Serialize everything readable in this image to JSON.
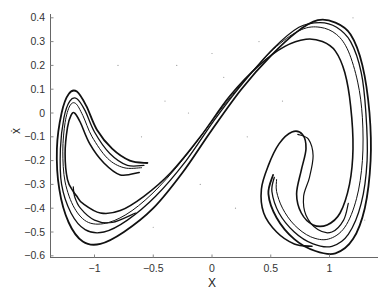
{
  "chart_data": {
    "type": "line",
    "title": "",
    "subtitle": "",
    "xlabel": "X",
    "ylabel": "ẋ",
    "xlim": [
      -1.38,
      1.41
    ],
    "ylim": [
      -0.6,
      0.42
    ],
    "x_ticks": [
      -1,
      -0.5,
      0,
      0.5,
      1
    ],
    "x_tick_labels": [
      "−1",
      "−0.5",
      "0",
      "0.5",
      "1"
    ],
    "y_ticks": [
      0.4,
      0.3,
      0.2,
      0.1,
      0,
      -0.1,
      -0.2,
      -0.3,
      -0.4,
      -0.5,
      -0.6
    ],
    "y_tick_labels": [
      "0.4",
      "0.3",
      "0.2",
      "0.1",
      "0",
      "−0.1",
      "−0.2",
      "−0.3",
      "−0.4",
      "−0.5",
      "−0.6"
    ],
    "grid": false,
    "legend": null,
    "series_color": "#111111",
    "series": [
      {
        "name": "outer-band",
        "width": 1.8,
        "points": [
          [
            -0.55,
            -0.21
          ],
          [
            -0.7,
            -0.2
          ],
          [
            -0.85,
            -0.15
          ],
          [
            -0.98,
            -0.07
          ],
          [
            -1.07,
            0.03
          ],
          [
            -1.15,
            0.09
          ],
          [
            -1.22,
            0.08
          ],
          [
            -1.28,
            0.0
          ],
          [
            -1.32,
            -0.15
          ],
          [
            -1.3,
            -0.32
          ],
          [
            -1.22,
            -0.46
          ],
          [
            -1.1,
            -0.54
          ],
          [
            -0.95,
            -0.55
          ],
          [
            -0.75,
            -0.5
          ],
          [
            -0.5,
            -0.4
          ],
          [
            -0.25,
            -0.25
          ],
          [
            0.0,
            -0.07
          ],
          [
            0.25,
            0.1
          ],
          [
            0.5,
            0.24
          ],
          [
            0.72,
            0.34
          ],
          [
            0.9,
            0.39
          ],
          [
            1.05,
            0.38
          ],
          [
            1.18,
            0.33
          ],
          [
            1.28,
            0.2
          ],
          [
            1.34,
            0.0
          ],
          [
            1.35,
            -0.2
          ],
          [
            1.3,
            -0.4
          ],
          [
            1.2,
            -0.53
          ],
          [
            1.05,
            -0.59
          ],
          [
            0.88,
            -0.58
          ],
          [
            0.7,
            -0.53
          ],
          [
            0.55,
            -0.44
          ],
          [
            0.48,
            -0.34
          ],
          [
            0.52,
            -0.26
          ]
        ]
      },
      {
        "name": "band-2",
        "width": 1.3,
        "points": [
          [
            -0.58,
            -0.22
          ],
          [
            -0.72,
            -0.22
          ],
          [
            -0.87,
            -0.17
          ],
          [
            -1.0,
            -0.08
          ],
          [
            -1.08,
            0.01
          ],
          [
            -1.15,
            0.06
          ],
          [
            -1.21,
            0.05
          ],
          [
            -1.26,
            -0.02
          ],
          [
            -1.29,
            -0.15
          ],
          [
            -1.28,
            -0.3
          ],
          [
            -1.2,
            -0.42
          ],
          [
            -1.08,
            -0.49
          ],
          [
            -0.92,
            -0.5
          ],
          [
            -0.72,
            -0.45
          ],
          [
            -0.48,
            -0.35
          ],
          [
            -0.22,
            -0.2
          ],
          [
            0.02,
            -0.03
          ],
          [
            0.27,
            0.13
          ],
          [
            0.52,
            0.27
          ],
          [
            0.74,
            0.36
          ],
          [
            0.92,
            0.38
          ],
          [
            1.06,
            0.36
          ],
          [
            1.18,
            0.3
          ],
          [
            1.27,
            0.17
          ],
          [
            1.31,
            0.0
          ],
          [
            1.32,
            -0.2
          ],
          [
            1.27,
            -0.38
          ],
          [
            1.16,
            -0.51
          ],
          [
            1.02,
            -0.56
          ],
          [
            0.86,
            -0.55
          ],
          [
            0.7,
            -0.5
          ],
          [
            0.57,
            -0.42
          ],
          [
            0.51,
            -0.33
          ],
          [
            0.53,
            -0.27
          ]
        ]
      },
      {
        "name": "band-3",
        "width": 1.0,
        "points": [
          [
            -0.6,
            -0.23
          ],
          [
            -0.75,
            -0.23
          ],
          [
            -0.89,
            -0.19
          ],
          [
            -1.02,
            -0.1
          ],
          [
            -1.1,
            -0.01
          ],
          [
            -1.16,
            0.04
          ],
          [
            -1.21,
            0.03
          ],
          [
            -1.25,
            -0.04
          ],
          [
            -1.27,
            -0.16
          ],
          [
            -1.25,
            -0.29
          ],
          [
            -1.17,
            -0.4
          ],
          [
            -1.05,
            -0.46
          ],
          [
            -0.88,
            -0.46
          ],
          [
            -0.68,
            -0.41
          ],
          [
            -0.45,
            -0.31
          ],
          [
            -0.19,
            -0.16
          ],
          [
            0.05,
            0.0
          ],
          [
            0.3,
            0.15
          ],
          [
            0.55,
            0.28
          ],
          [
            0.76,
            0.35
          ],
          [
            0.92,
            0.36
          ],
          [
            1.06,
            0.33
          ],
          [
            1.16,
            0.26
          ],
          [
            1.24,
            0.13
          ],
          [
            1.28,
            -0.02
          ],
          [
            1.28,
            -0.2
          ],
          [
            1.23,
            -0.36
          ],
          [
            1.13,
            -0.48
          ],
          [
            0.99,
            -0.53
          ],
          [
            0.84,
            -0.52
          ],
          [
            0.7,
            -0.47
          ],
          [
            0.6,
            -0.4
          ],
          [
            0.55,
            -0.33
          ],
          [
            0.55,
            -0.28
          ]
        ]
      },
      {
        "name": "inner-band",
        "width": 1.6,
        "points": [
          [
            -0.62,
            -0.25
          ],
          [
            -0.78,
            -0.26
          ],
          [
            -0.92,
            -0.21
          ],
          [
            -1.04,
            -0.13
          ],
          [
            -1.12,
            -0.04
          ],
          [
            -1.17,
            0.0
          ],
          [
            -1.2,
            -0.01
          ],
          [
            -1.23,
            -0.06
          ],
          [
            -1.25,
            -0.17
          ],
          [
            -1.23,
            -0.28
          ],
          [
            -1.18,
            -0.33
          ],
          [
            -1.15,
            -0.35
          ],
          [
            -1.1,
            -0.38
          ],
          [
            -0.95,
            -0.42
          ],
          [
            -0.78,
            -0.41
          ],
          [
            -0.58,
            -0.35
          ],
          [
            -0.35,
            -0.25
          ],
          [
            -0.1,
            -0.1
          ],
          [
            0.15,
            0.07
          ],
          [
            0.4,
            0.2
          ],
          [
            0.62,
            0.28
          ],
          [
            0.8,
            0.31
          ],
          [
            0.94,
            0.3
          ],
          [
            1.05,
            0.26
          ],
          [
            1.13,
            0.17
          ],
          [
            1.18,
            0.03
          ],
          [
            1.2,
            -0.15
          ],
          [
            1.17,
            -0.3
          ],
          [
            1.09,
            -0.42
          ],
          [
            0.98,
            -0.47
          ],
          [
            0.86,
            -0.47
          ],
          [
            0.76,
            -0.42
          ],
          [
            0.72,
            -0.34
          ],
          [
            0.76,
            -0.24
          ],
          [
            0.8,
            -0.15
          ],
          [
            0.77,
            -0.09
          ],
          [
            0.68,
            -0.08
          ],
          [
            0.57,
            -0.13
          ],
          [
            0.48,
            -0.22
          ],
          [
            0.42,
            -0.32
          ],
          [
            0.44,
            -0.42
          ],
          [
            0.55,
            -0.5
          ],
          [
            0.7,
            -0.55
          ],
          [
            0.85,
            -0.56
          ]
        ]
      },
      {
        "name": "right-lobe-inner",
        "width": 1.2,
        "points": [
          [
            0.73,
            -0.09
          ],
          [
            0.82,
            -0.11
          ],
          [
            0.86,
            -0.18
          ],
          [
            0.83,
            -0.27
          ],
          [
            0.78,
            -0.35
          ],
          [
            0.8,
            -0.43
          ],
          [
            0.9,
            -0.49
          ],
          [
            1.02,
            -0.5
          ],
          [
            1.12,
            -0.45
          ],
          [
            1.16,
            -0.38
          ]
        ]
      },
      {
        "name": "left-hook-inner",
        "width": 1.2,
        "points": [
          [
            -1.18,
            -0.31
          ],
          [
            -1.17,
            -0.35
          ],
          [
            -1.12,
            -0.4
          ],
          [
            -1.0,
            -0.45
          ],
          [
            -0.85,
            -0.46
          ],
          [
            -0.65,
            -0.42
          ]
        ]
      }
    ],
    "scatter_noise_points": [
      [
        -0.4,
        0.05
      ],
      [
        -0.2,
        0.0
      ],
      [
        0.1,
        0.15
      ],
      [
        -0.6,
        -0.1
      ],
      [
        0.3,
        -0.1
      ],
      [
        -0.1,
        -0.3
      ],
      [
        0.4,
        0.3
      ],
      [
        -0.8,
        0.2
      ],
      [
        0.2,
        -0.4
      ],
      [
        1.2,
        0.4
      ],
      [
        -0.3,
        0.2
      ],
      [
        0.0,
        0.25
      ],
      [
        1.3,
        -0.45
      ],
      [
        0.6,
        0.05
      ],
      [
        -0.5,
        -0.48
      ]
    ]
  }
}
